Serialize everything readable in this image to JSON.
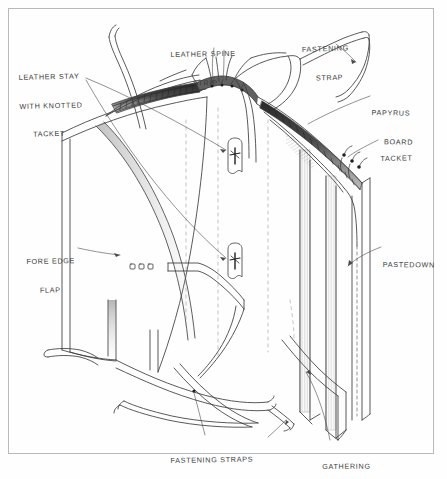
{
  "document": {
    "type": "hand-drawn technical sketch",
    "subject": "Coptic / Ethiopian style book binding structure",
    "border_color": "#b9b9b9",
    "ink_color": "#3a3a3a",
    "paper_color": "#fefefe"
  },
  "labels": [
    {
      "id": "leather-stay",
      "lines": [
        "LEATHER STAY",
        "WITH KNOTTED",
        "TACKET"
      ],
      "x": 18,
      "y": 54,
      "align": "left",
      "leader": "line to knotted tacket detail at centre of board"
    },
    {
      "id": "leather-spine-strip",
      "lines": [
        "LEATHER SPINE",
        "STRIP"
      ],
      "x": 170,
      "y": 31,
      "align": "left",
      "leader": "two lines to spine strip edges"
    },
    {
      "id": "fastening-strap",
      "lines": [
        "FASTENING",
        "STRAP"
      ],
      "x": 301,
      "y": 26,
      "align": "left",
      "leader": "curved line to upper right strap"
    },
    {
      "id": "papyrus-board",
      "lines": [
        "PAPYRUS",
        "BOARD"
      ],
      "x": 372,
      "y": 89,
      "align": "left",
      "leader": "line to laminated board edge"
    },
    {
      "id": "tacket",
      "lines": [
        "TACKET"
      ],
      "x": 380,
      "y": 135,
      "align": "left",
      "leader": "short line to tacket knots on right board"
    },
    {
      "id": "fore-edge-flap",
      "lines": [
        "FORE EDGE",
        "FLAP"
      ],
      "x": 26,
      "y": 238,
      "align": "left",
      "leader": "arrow pointing right to flap"
    },
    {
      "id": "pastedown",
      "lines": [
        "PASTEDOWN"
      ],
      "x": 383,
      "y": 241,
      "align": "left",
      "leader": "arrow curving down-left to inner board face"
    },
    {
      "id": "fastening-straps",
      "lines": [
        "FASTENING STRAPS"
      ],
      "x": 170,
      "y": 437,
      "align": "left",
      "leader": "lines up to strap crossing and to loose strap end"
    },
    {
      "id": "gathering",
      "lines": [
        "GATHERING"
      ],
      "x": 322,
      "y": 443,
      "align": "left",
      "leader": "long line up to text block arrow"
    }
  ]
}
